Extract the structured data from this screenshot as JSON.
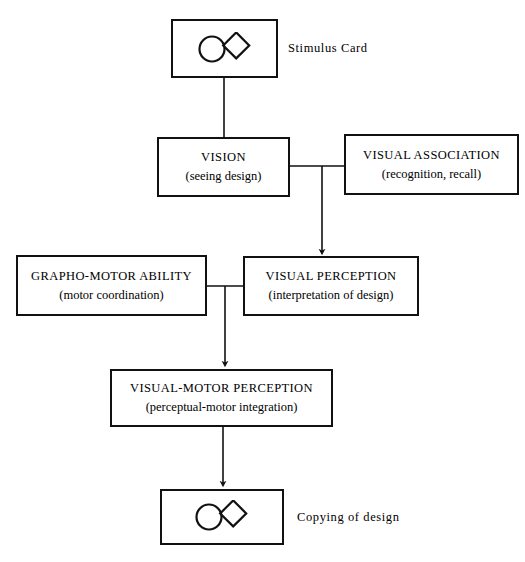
{
  "diagram": {
    "title_text": "",
    "stroke_color": "#111111",
    "background_color": "#ffffff",
    "nodes": {
      "stimulus_card": {
        "label": "Stimulus Card",
        "figure": "circle-diamond-figure"
      },
      "vision": {
        "title": "VISION",
        "subtitle": "(seeing design)"
      },
      "visual_association": {
        "title": "VISUAL ASSOCIATION",
        "subtitle": "(recognition, recall)"
      },
      "grapho_motor_ability": {
        "title": "GRAPHO-MOTOR ABILITY",
        "subtitle": "(motor coordination)"
      },
      "visual_perception": {
        "title": "VISUAL PERCEPTION",
        "subtitle": "(interpretation of design)"
      },
      "visual_motor_perception": {
        "title": "VISUAL-MOTOR PERCEPTION",
        "subtitle": "(perceptual-motor integration)"
      },
      "copying_of_design": {
        "label": "Copying of design",
        "figure": "circle-diamond-figure"
      }
    }
  }
}
